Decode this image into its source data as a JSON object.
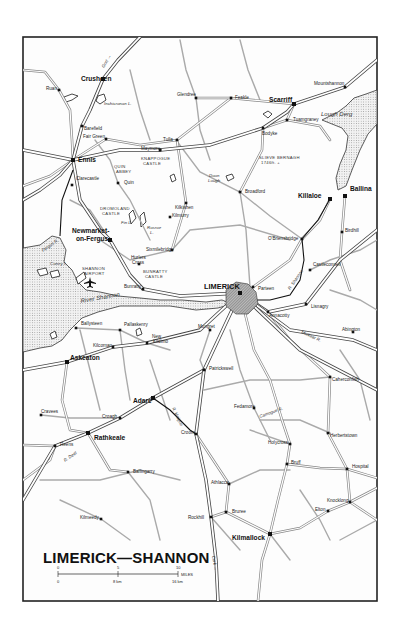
{
  "map": {
    "title": "LIMERICK—SHANNON",
    "frame": {
      "x": 23,
      "y": 37,
      "w": 354,
      "h": 564
    },
    "scale": {
      "miles_ticks": [
        "0",
        "5",
        "10"
      ],
      "miles_unit": "MILES",
      "km_ticks": [
        "0",
        "8 km",
        "16 km"
      ]
    },
    "towns_major": [
      {
        "name": "Ennis",
        "x": 73,
        "y": 160,
        "lx": 78,
        "ly": 162
      },
      {
        "name": "Limerick",
        "label": "LIMERICK",
        "x": 240,
        "y": 293,
        "lx": 204,
        "ly": 289
      },
      {
        "name": "Killaloe",
        "x": 330,
        "y": 199,
        "lx": 298,
        "ly": 198
      },
      {
        "name": "Ballina",
        "x": 345,
        "y": 196,
        "lx": 350,
        "ly": 191
      },
      {
        "name": "Scarriff",
        "x": 294,
        "y": 104,
        "lx": 269,
        "ly": 102
      },
      {
        "name": "Crusheen",
        "x": 103,
        "y": 79,
        "lx": 81,
        "ly": 81
      },
      {
        "name": "Newmarket-on-Fergus",
        "label1": "Newmarket-",
        "label2": "on-Fergus",
        "x": 110,
        "y": 240,
        "lx": 72,
        "ly": 233
      },
      {
        "name": "Askeaton",
        "x": 67,
        "y": 362,
        "lx": 70,
        "ly": 360
      },
      {
        "name": "Adare",
        "x": 153,
        "y": 398,
        "lx": 133,
        "ly": 403
      },
      {
        "name": "Rathkeale",
        "x": 88,
        "y": 433,
        "lx": 94,
        "ly": 440
      },
      {
        "name": "Kilmallock",
        "x": 270,
        "y": 534,
        "lx": 232,
        "ly": 540
      }
    ],
    "towns_minor": [
      {
        "name": "Ruan",
        "x": 59,
        "y": 90,
        "lx": 46,
        "ly": 90
      },
      {
        "name": "Barefield",
        "x": 82,
        "y": 126,
        "lx": 84,
        "ly": 130
      },
      {
        "name": "Fair Green",
        "x": 106,
        "y": 139,
        "lx": 83,
        "ly": 138
      },
      {
        "name": "Clarecastle",
        "x": 72,
        "y": 185,
        "lx": 76,
        "ly": 180
      },
      {
        "name": "Quin",
        "x": 118,
        "y": 183,
        "lx": 124,
        "ly": 184
      },
      {
        "name": "Glendree",
        "x": 196,
        "y": 98,
        "lx": 177,
        "ly": 96
      },
      {
        "name": "Feakle",
        "x": 231,
        "y": 98,
        "lx": 235,
        "ly": 99
      },
      {
        "name": "Tulla",
        "x": 177,
        "y": 140,
        "lx": 163,
        "ly": 141
      },
      {
        "name": "Maymore",
        "x": 160,
        "y": 150,
        "lx": 141,
        "ly": 150
      },
      {
        "name": "Bodyke",
        "x": 263,
        "y": 128,
        "lx": 262,
        "ly": 135
      },
      {
        "name": "Tuamgraney",
        "x": 287,
        "y": 120,
        "lx": 293,
        "ly": 121
      },
      {
        "name": "Mountshannon",
        "x": 345,
        "y": 87,
        "lx": 314,
        "ly": 85
      },
      {
        "name": "Kilkishen",
        "x": 186,
        "y": 203,
        "lx": 175,
        "ly": 209
      },
      {
        "name": "Broadford",
        "x": 240,
        "y": 192,
        "lx": 245,
        "ly": 193
      },
      {
        "name": "Kilmurry",
        "x": 170,
        "y": 217,
        "lx": 172,
        "ly": 217
      },
      {
        "name": "O'Briensbridge",
        "x": 302,
        "y": 239,
        "lx": 268,
        "ly": 240
      },
      {
        "name": "Birdhill",
        "x": 342,
        "y": 232,
        "lx": 345,
        "ly": 232
      },
      {
        "name": "Sixmilebridge",
        "x": 172,
        "y": 250,
        "lx": 146,
        "ly": 251
      },
      {
        "name": "Hurlers Cross",
        "label1": "Hurlers",
        "label2": "Cross",
        "x": 139,
        "y": 264,
        "lx": 131,
        "ly": 259
      },
      {
        "name": "Bunratty",
        "x": 143,
        "y": 289,
        "lx": 124,
        "ly": 288
      },
      {
        "name": "Castleconnell",
        "x": 310,
        "y": 270,
        "lx": 313,
        "ly": 266
      },
      {
        "name": "Parteen",
        "x": 253,
        "y": 287,
        "lx": 258,
        "ly": 290
      },
      {
        "name": "Annacotty",
        "x": 268,
        "y": 312,
        "lx": 269,
        "ly": 317
      },
      {
        "name": "Lisnagry",
        "x": 306,
        "y": 304,
        "lx": 311,
        "ly": 308
      },
      {
        "name": "Abington",
        "x": 353,
        "y": 332,
        "lx": 342,
        "ly": 331
      },
      {
        "name": "Ballysteen",
        "x": 76,
        "y": 328,
        "lx": 81,
        "ly": 325
      },
      {
        "name": "Pallaskenry",
        "x": 120,
        "y": 330,
        "lx": 124,
        "ly": 326
      },
      {
        "name": "Kilcornan",
        "x": 113,
        "y": 347,
        "lx": 93,
        "ly": 347
      },
      {
        "name": "New Kildimo",
        "label1": "New",
        "label2": "Kildimo",
        "x": 147,
        "y": 343,
        "lx": 152,
        "ly": 338
      },
      {
        "name": "Mungret",
        "x": 210,
        "y": 330,
        "lx": 198,
        "ly": 328
      },
      {
        "name": "Patrickswell",
        "x": 204,
        "y": 370,
        "lx": 209,
        "ly": 370
      },
      {
        "name": "Caherconlish",
        "x": 330,
        "y": 377,
        "lx": 332,
        "ly": 381
      },
      {
        "name": "Fedamore",
        "x": 254,
        "y": 408,
        "lx": 234,
        "ly": 408
      },
      {
        "name": "Croagh",
        "x": 120,
        "y": 418,
        "lx": 102,
        "ly": 418
      },
      {
        "name": "Croom",
        "x": 196,
        "y": 434,
        "lx": 181,
        "ly": 434
      },
      {
        "name": "Cravees",
        "x": 41,
        "y": 415,
        "lx": 41,
        "ly": 413
      },
      {
        "name": "Reens",
        "x": 55,
        "y": 446,
        "lx": 60,
        "ly": 446
      },
      {
        "name": "Herbertstown",
        "x": 328,
        "y": 433,
        "lx": 330,
        "ly": 437
      },
      {
        "name": "Holycross",
        "x": 290,
        "y": 444,
        "lx": 268,
        "ly": 444
      },
      {
        "name": "Bruff",
        "x": 287,
        "y": 464,
        "lx": 291,
        "ly": 464
      },
      {
        "name": "Hospital",
        "x": 347,
        "y": 469,
        "lx": 352,
        "ly": 468
      },
      {
        "name": "Ballingarry",
        "x": 128,
        "y": 472,
        "lx": 133,
        "ly": 473
      },
      {
        "name": "Athlacca",
        "x": 229,
        "y": 484,
        "lx": 211,
        "ly": 484
      },
      {
        "name": "Knocklong",
        "x": 350,
        "y": 502,
        "lx": 327,
        "ly": 502
      },
      {
        "name": "Elton",
        "x": 328,
        "y": 511,
        "lx": 315,
        "ly": 511
      },
      {
        "name": "Bruree",
        "x": 226,
        "y": 512,
        "lx": 232,
        "ly": 513
      },
      {
        "name": "Kilmeedy",
        "x": 101,
        "y": 519,
        "lx": 80,
        "ly": 519
      },
      {
        "name": "Rockhill",
        "x": 211,
        "y": 517,
        "lx": 188,
        "ly": 519
      }
    ],
    "features": [
      {
        "name": "Inchicronan L.",
        "x": 104,
        "y": 105,
        "cls": "lbl-water-sm"
      },
      {
        "name": "Lough Derg",
        "x": 321,
        "y": 116,
        "cls": "lbl-water"
      },
      {
        "name": "Doon",
        "x": 209,
        "y": 177,
        "cls": "lbl-water-sm"
      },
      {
        "name": "Lough",
        "x": 208,
        "y": 182,
        "cls": "lbl-water-sm"
      },
      {
        "name": "Fin L.",
        "x": 121,
        "y": 224,
        "cls": "lbl-water-sm"
      },
      {
        "name": "Rosroe",
        "x": 147,
        "y": 229,
        "cls": "lbl-water-sm"
      },
      {
        "name": "L.",
        "x": 150,
        "y": 234,
        "cls": "lbl-water-sm"
      },
      {
        "name": "Coney I.",
        "x": 50,
        "y": 265,
        "cls": "lbl-water-sm"
      },
      {
        "name": "Fergus R.",
        "x": 43,
        "y": 252,
        "cls": "lbl-water-sm",
        "rot": -35
      },
      {
        "name": "River Shannon",
        "x": 81,
        "y": 303,
        "cls": "lbl-water",
        "rot": -10
      },
      {
        "name": "R. Shannon",
        "x": 290,
        "y": 290,
        "cls": "lbl-water-sm",
        "rot": -55
      },
      {
        "name": "Mulkear R.",
        "x": 301,
        "y": 333,
        "cls": "lbl-water-sm",
        "rot": 25
      },
      {
        "name": "R. Maigue",
        "x": 172,
        "y": 408,
        "cls": "lbl-water-sm",
        "rot": 65
      },
      {
        "name": "Camogue R.",
        "x": 260,
        "y": 418,
        "cls": "lbl-water-sm",
        "rot": -20
      },
      {
        "name": "R. Deel",
        "x": 65,
        "y": 462,
        "cls": "lbl-water-sm",
        "rot": -35
      },
      {
        "name": "Sixmilebridge-Cork",
        "label": "Cork →",
        "x": 212,
        "y": 556,
        "cls": "lbl-water-sm",
        "rot": 80
      },
      {
        "name": "Gort",
        "label": "Gort →",
        "x": 104,
        "y": 68,
        "cls": "lbl-water-sm",
        "rot": -60
      }
    ],
    "landmarks": [
      {
        "name": "KNAPPOGUE CASTLE",
        "line1": "KNAPPOGUE",
        "line2": "CASTLE",
        "x": 141,
        "y": 160
      },
      {
        "name": "QUIN ABBEY",
        "line1": "QUIN",
        "line2": "ABBEY",
        "x": 114,
        "y": 168
      },
      {
        "name": "DROMOLAND CASTLE",
        "line1": "DROMOLAND",
        "line2": "CASTLE",
        "x": 100,
        "y": 210
      },
      {
        "name": "SHANNON AIRPORT",
        "line1": "SHANNON",
        "line2": "AIRPORT",
        "x": 82,
        "y": 270
      },
      {
        "name": "BUNRATTY CASTLE",
        "line1": "BUNRATTY",
        "line2": "CASTLE",
        "x": 143,
        "y": 273
      },
      {
        "name": "SLIEVE BERNAGH",
        "line1": "SLIEVE BERNAGH",
        "line2": "1746ft. +",
        "x": 259,
        "y": 159
      }
    ]
  }
}
